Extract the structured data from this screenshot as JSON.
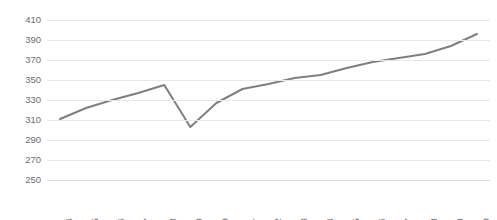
{
  "chart_data": {
    "type": "line",
    "title": "",
    "xlabel": "",
    "ylabel": "",
    "categories": [
      "2004",
      "2005",
      "2006",
      "2007",
      "2008",
      "2009",
      "2010",
      "2011",
      "2012",
      "2013",
      "2014",
      "2015",
      "2016",
      "2017",
      "2018",
      "2019",
      "2020"
    ],
    "values": [
      311,
      322,
      330,
      337,
      345,
      303,
      327,
      341,
      346,
      352,
      355,
      362,
      368,
      372,
      376,
      384,
      396
    ],
    "series": [
      {
        "name": "",
        "values": [
          311,
          322,
          330,
          337,
          345,
          303,
          327,
          341,
          346,
          352,
          355,
          362,
          368,
          372,
          376,
          384,
          396
        ]
      }
    ],
    "ylim": [
      250,
      410
    ],
    "ytick_values": [
      410,
      390,
      370,
      350,
      330,
      310,
      290,
      270,
      250
    ],
    "ytick_labels": [
      "410",
      "390",
      "370",
      "350",
      "330",
      "310",
      "290",
      "270",
      "250"
    ],
    "ystep": 20,
    "grid": true,
    "grid_axis": "y",
    "legend": "none",
    "line_color": "#7f7f7f",
    "line_width": 2,
    "gridline_color": "#e8e8e8",
    "axis_label_color": "#6e6e6e",
    "background_color": "#ffffff",
    "markers": false
  }
}
